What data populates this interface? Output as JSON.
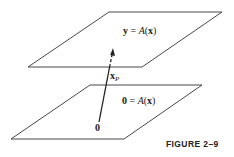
{
  "diagram": {
    "top_plane": {
      "equation_lhs": "y",
      "equation_eq": " = ",
      "equation_fn": "A",
      "equation_open": "(",
      "equation_arg": "x",
      "equation_close": ")",
      "corners": [
        [
          109,
          12
        ],
        [
          222,
          12
        ],
        [
          142,
          67
        ],
        [
          28,
          67
        ]
      ]
    },
    "bottom_plane": {
      "equation_lhs": "0",
      "equation_eq": " = ",
      "equation_fn": "A",
      "equation_open": "(",
      "equation_arg": "x",
      "equation_close": ")",
      "corners": [
        [
          90,
          85
        ],
        [
          202,
          85
        ],
        [
          124,
          139
        ],
        [
          11,
          139
        ]
      ]
    },
    "vector": {
      "label_main": "x",
      "label_sub": "P",
      "origin_label": "0",
      "from": [
        99,
        122
      ],
      "to": [
        113,
        49
      ]
    },
    "caption": "FIGURE 2–9"
  }
}
